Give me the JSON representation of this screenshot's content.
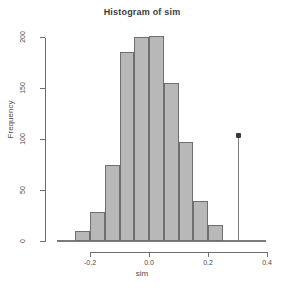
{
  "chart_data": {
    "type": "bar",
    "title": "Histogram of sim",
    "xlabel": "sim",
    "ylabel": "Frequency",
    "xlim": [
      -0.28,
      0.41
    ],
    "ylim": [
      0,
      205
    ],
    "grid": false,
    "legend": null,
    "bin_width": 0.05,
    "bin_edges": [
      -0.25,
      -0.2,
      -0.15,
      -0.1,
      -0.05,
      0.0,
      0.05,
      0.1,
      0.15,
      0.2,
      0.25
    ],
    "categories": [
      "-0.25",
      "-0.20",
      "-0.15",
      "-0.10",
      "-0.05",
      "0.00",
      "0.05",
      "0.10",
      "0.15",
      "0.20"
    ],
    "values": [
      10,
      28,
      75,
      185,
      200,
      201,
      155,
      97,
      39,
      16
    ],
    "xticks": [
      -0.2,
      0.0,
      0.2,
      0.4
    ],
    "xticklabels": [
      "-0.2",
      "0.0",
      "0.2",
      "0.4"
    ],
    "yticks": [
      0,
      50,
      100,
      150,
      200
    ],
    "yticklabels": [
      "0",
      "50",
      "100",
      "150",
      "200"
    ],
    "annotations": [
      {
        "type": "needle",
        "name": "observed-value-spike",
        "x": 0.3,
        "y": 103,
        "marker": "point"
      }
    ],
    "colors": {
      "bar_fill": "#b8b8b8",
      "bar_border": "#6f6f6f",
      "axis": "#6e6e6e",
      "text": "#4a4a4a",
      "title": "#3b3b3b",
      "needle": "#787878",
      "marker": "#3a3a3a"
    }
  }
}
